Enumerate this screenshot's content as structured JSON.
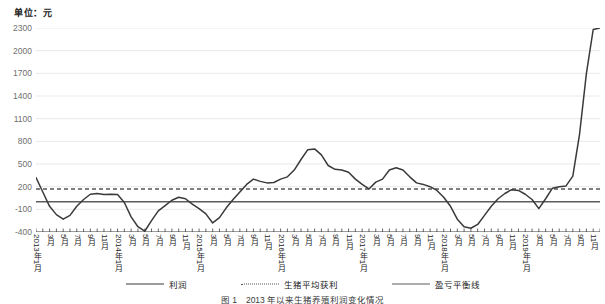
{
  "unit_label": "单位：元",
  "legend": {
    "items": [
      {
        "name": "profit",
        "label": "利润",
        "style": "solid-dark",
        "color": "#3a3a3a"
      },
      {
        "name": "average-profit",
        "label": "生猪平均获利",
        "style": "dotted",
        "color": "#555555"
      },
      {
        "name": "breakeven-line",
        "label": "盈亏平衡线",
        "style": "solid-gray",
        "color": "#5c5c5c"
      }
    ]
  },
  "caption": "图 1　2013 年以来生猪养殖利润变化情况",
  "chart_data": {
    "type": "line",
    "title": "",
    "subtitle": "",
    "xlabel": "",
    "ylabel": "单位：元",
    "ylim": [
      -400,
      2300
    ],
    "yticks": [
      -400,
      -100,
      200,
      500,
      800,
      1100,
      1400,
      1700,
      2000,
      2300
    ],
    "grid": true,
    "legend_position": "bottom",
    "x": [
      "2013年1月",
      "2013年2月",
      "2013年3月",
      "2013年4月",
      "2013年5月",
      "2013年6月",
      "2013年7月",
      "2013年8月",
      "2013年9月",
      "2013年10月",
      "2013年11月",
      "2013年12月",
      "2014年1月",
      "2014年2月",
      "2014年3月",
      "2014年4月",
      "2014年5月",
      "2014年6月",
      "2014年7月",
      "2014年8月",
      "2014年9月",
      "2014年10月",
      "2014年11月",
      "2014年12月",
      "2015年1月",
      "2015年2月",
      "2015年3月",
      "2015年4月",
      "2015年5月",
      "2015年6月",
      "2015年7月",
      "2015年8月",
      "2015年9月",
      "2015年10月",
      "2015年11月",
      "2015年12月",
      "2016年1月",
      "2016年2月",
      "2016年3月",
      "2016年4月",
      "2016年5月",
      "2016年6月",
      "2016年7月",
      "2016年8月",
      "2016年9月",
      "2016年10月",
      "2016年11月",
      "2016年12月",
      "2017年1月",
      "2017年2月",
      "2017年3月",
      "2017年4月",
      "2017年5月",
      "2017年6月",
      "2017年7月",
      "2017年8月",
      "2017年9月",
      "2017年10月",
      "2017年11月",
      "2017年12月",
      "2018年1月",
      "2018年2月",
      "2018年3月",
      "2018年4月",
      "2018年5月",
      "2018年6月",
      "2018年7月",
      "2018年8月",
      "2018年9月",
      "2018年10月",
      "2018年11月",
      "2018年12月",
      "2019年1月",
      "2019年2月",
      "2019年3月",
      "2019年4月",
      "2019年5月",
      "2019年6月",
      "2019年7月",
      "2019年8月",
      "2019年9月",
      "2019年10月",
      "2019年11月",
      "2019年12月"
    ],
    "xtick_labels": [
      {
        "index": 0,
        "label": "2013年1月"
      },
      {
        "index": 2,
        "label": "3月"
      },
      {
        "index": 4,
        "label": "5月"
      },
      {
        "index": 6,
        "label": "7月"
      },
      {
        "index": 8,
        "label": "9月"
      },
      {
        "index": 10,
        "label": "11月"
      },
      {
        "index": 12,
        "label": "2014年1月"
      },
      {
        "index": 14,
        "label": "3月"
      },
      {
        "index": 16,
        "label": "5月"
      },
      {
        "index": 18,
        "label": "7月"
      },
      {
        "index": 20,
        "label": "9月"
      },
      {
        "index": 22,
        "label": "11月"
      },
      {
        "index": 24,
        "label": "2015年1月"
      },
      {
        "index": 26,
        "label": "3月"
      },
      {
        "index": 28,
        "label": "5月"
      },
      {
        "index": 30,
        "label": "7月"
      },
      {
        "index": 32,
        "label": "9月"
      },
      {
        "index": 34,
        "label": "11月"
      },
      {
        "index": 36,
        "label": "2016年1月"
      },
      {
        "index": 38,
        "label": "3月"
      },
      {
        "index": 40,
        "label": "5月"
      },
      {
        "index": 42,
        "label": "7月"
      },
      {
        "index": 44,
        "label": "9月"
      },
      {
        "index": 46,
        "label": "11月"
      },
      {
        "index": 48,
        "label": "2017年1月"
      },
      {
        "index": 50,
        "label": "3月"
      },
      {
        "index": 52,
        "label": "5月"
      },
      {
        "index": 54,
        "label": "7月"
      },
      {
        "index": 56,
        "label": "9月"
      },
      {
        "index": 58,
        "label": "11月"
      },
      {
        "index": 60,
        "label": "2018年1月"
      },
      {
        "index": 62,
        "label": "3月"
      },
      {
        "index": 64,
        "label": "5月"
      },
      {
        "index": 66,
        "label": "7月"
      },
      {
        "index": 68,
        "label": "9月"
      },
      {
        "index": 70,
        "label": "11月"
      },
      {
        "index": 72,
        "label": "2019年1月"
      },
      {
        "index": 74,
        "label": "3月"
      },
      {
        "index": 76,
        "label": "5月"
      },
      {
        "index": 78,
        "label": "7月"
      },
      {
        "index": 80,
        "label": "9月"
      },
      {
        "index": 82,
        "label": "11月"
      }
    ],
    "series": [
      {
        "name": "利润",
        "type": "line",
        "color": "#3a3a3a",
        "style": "solid",
        "values": [
          320,
          130,
          -60,
          -170,
          -230,
          -180,
          -60,
          30,
          100,
          110,
          95,
          100,
          95,
          -10,
          -200,
          -330,
          -390,
          -250,
          -120,
          -50,
          20,
          60,
          40,
          -30,
          -90,
          -160,
          -280,
          -210,
          -80,
          30,
          130,
          230,
          300,
          270,
          250,
          255,
          300,
          330,
          420,
          560,
          690,
          700,
          620,
          480,
          430,
          420,
          390,
          300,
          230,
          170,
          260,
          300,
          420,
          450,
          420,
          330,
          250,
          230,
          200,
          150,
          60,
          -60,
          -230,
          -330,
          -350,
          -300,
          -180,
          -60,
          40,
          110,
          160,
          150,
          100,
          30,
          -90,
          40,
          180,
          200,
          210,
          340,
          900,
          1700,
          2280,
          2300
        ]
      },
      {
        "name": "生猪平均获利",
        "type": "reference-line",
        "color": "#555555",
        "style": "dotted",
        "value": 170
      },
      {
        "name": "盈亏平衡线",
        "type": "reference-line",
        "color": "#5c5c5c",
        "style": "solid",
        "value": 0
      }
    ]
  }
}
